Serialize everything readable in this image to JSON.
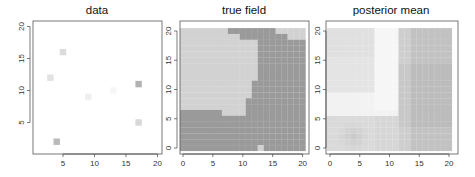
{
  "chart_data": [
    {
      "type": "scatter",
      "title": "data",
      "xlabel": "",
      "ylabel": "",
      "xlim": [
        0.2,
        20.7
      ],
      "ylim": [
        0.2,
        20.7
      ],
      "xticks": [
        "5",
        "10",
        "15",
        "20"
      ],
      "yticks": [
        "5",
        "10",
        "15",
        "20"
      ],
      "points": [
        {
          "x": 5,
          "y": 16,
          "color": "#dcdcdc"
        },
        {
          "x": 3,
          "y": 12,
          "color": "#e2e2e2"
        },
        {
          "x": 17,
          "y": 11,
          "color": "#b2b2b2"
        },
        {
          "x": 13,
          "y": 10,
          "color": "#f7f7f7"
        },
        {
          "x": 9,
          "y": 9,
          "color": "#efefef"
        },
        {
          "x": 17,
          "y": 5,
          "color": "#d8d8d8"
        },
        {
          "x": 4,
          "y": 2,
          "color": "#b9b9b9"
        }
      ],
      "grid": false
    },
    {
      "type": "heatmap",
      "title": "true field",
      "xlim": [
        -0.5,
        20.5
      ],
      "ylim": [
        -0.5,
        20.5
      ],
      "xticks": [
        "0",
        "5",
        "10",
        "15",
        "20"
      ],
      "yticks": [
        "0",
        "5",
        "10",
        "15",
        "20"
      ],
      "colors": {
        "low": "#d2d2d2",
        "high": "#9a9a9a"
      },
      "rows_top_to_bottom": [
        "000000001111111100000",
        "000000000011111111000",
        "000000000000011111111",
        "000000000000011111111",
        "000000000000011111111",
        "000000000000011111111",
        "000000000000011111111",
        "000000000000011111111",
        "000000000000011111111",
        "000000000000111111111",
        "000000000000111111111",
        "000000000000111111111",
        "000000000001111111111",
        "000000000001111111111",
        "111111100001111111111",
        "111111111111111111111",
        "111111111111111111111",
        "111111111111111111111",
        "111111111111111111111",
        "111111111111111111111",
        "111111111111101111111"
      ]
    },
    {
      "type": "heatmap",
      "title": "posterior mean",
      "xlim": [
        -0.5,
        20.5
      ],
      "ylim": [
        -0.5,
        20.5
      ],
      "xticks": [
        "0",
        "5",
        "10",
        "15",
        "20"
      ],
      "yticks": [
        "0",
        "5",
        "10",
        "15",
        "20"
      ],
      "description": "smooth gray field: light gray upper-left, white vertical band near x=9-11 and horizontal band near y=6-9, darker gray on right (x>=13) and bottom (y<=5), darkest spot near (4,2)"
    }
  ]
}
